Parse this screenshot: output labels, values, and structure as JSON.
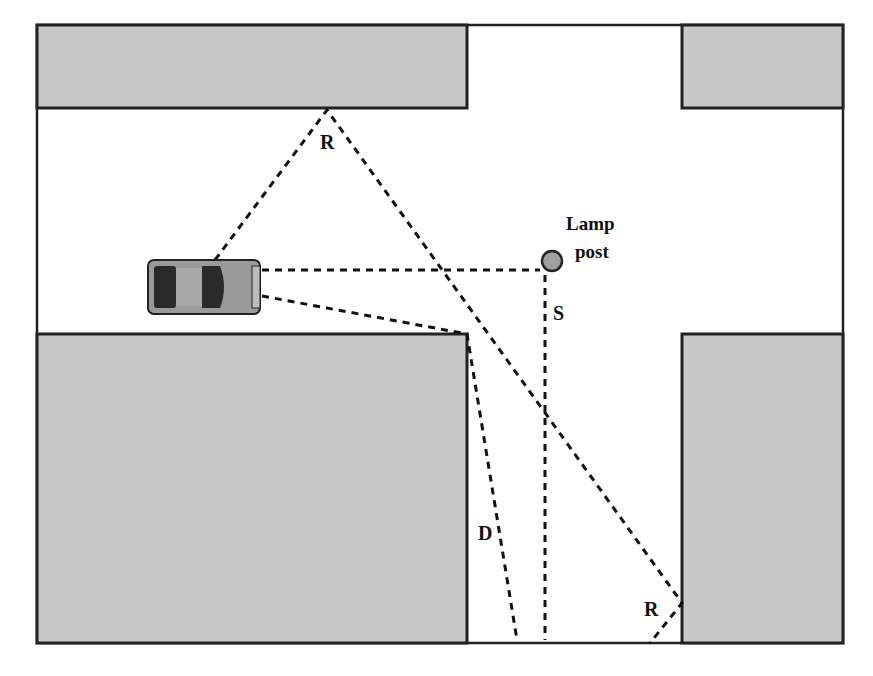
{
  "diagram": {
    "type": "top-down street intersection sight-line diagram",
    "labels": {
      "reflection_top": "R",
      "reflection_bottom": "R",
      "direct": "D",
      "scatter": "S",
      "lamp_line1": "Lamp",
      "lamp_line2": "post"
    },
    "colors": {
      "building_fill": "#c8c8c8",
      "outline": "#222222",
      "lamp_fill": "#a0a0a0",
      "car_body": "#9a9a9a",
      "car_glass": "#2a2a2a",
      "background": "#ffffff"
    },
    "elements": [
      {
        "name": "building-top-left"
      },
      {
        "name": "building-top-right"
      },
      {
        "name": "building-bottom-left"
      },
      {
        "name": "building-bottom-right"
      },
      {
        "name": "car"
      },
      {
        "name": "lamp-post"
      }
    ]
  }
}
